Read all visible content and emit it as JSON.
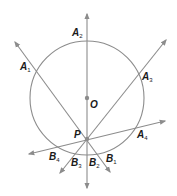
{
  "diagram": {
    "type": "geometry",
    "colors": {
      "stroke": "#8c8c8c",
      "text": "#1a1a1a",
      "background": "#ffffff"
    },
    "circle": {
      "center_label": "O",
      "cx": 87,
      "cy": 98,
      "r": 57
    },
    "point_P": {
      "label": "P",
      "x": 87,
      "y": 139
    },
    "labels": {
      "O": {
        "main": "O",
        "sub": ""
      },
      "P": {
        "main": "P",
        "sub": ""
      },
      "A1": {
        "main": "A",
        "sub": "1"
      },
      "A2": {
        "main": "A",
        "sub": "2"
      },
      "A3": {
        "main": "A",
        "sub": "3"
      },
      "A4": {
        "main": "A",
        "sub": "4"
      },
      "B1": {
        "main": "B",
        "sub": "1"
      },
      "B2": {
        "main": "B",
        "sub": "2"
      },
      "B3": {
        "main": "B",
        "sub": "3"
      },
      "B4": {
        "main": "B",
        "sub": "4"
      }
    },
    "lines": [
      {
        "name": "A1B1",
        "from": [
          15,
          42
        ],
        "to": [
          110,
          172
        ]
      },
      {
        "name": "A2B2",
        "from": [
          87,
          14
        ],
        "to": [
          87,
          188
        ]
      },
      {
        "name": "A3B3",
        "from": [
          166,
          40
        ],
        "to": [
          60,
          173
        ]
      },
      {
        "name": "A4B4",
        "from": [
          165,
          121
        ],
        "to": [
          29,
          154
        ]
      }
    ]
  }
}
